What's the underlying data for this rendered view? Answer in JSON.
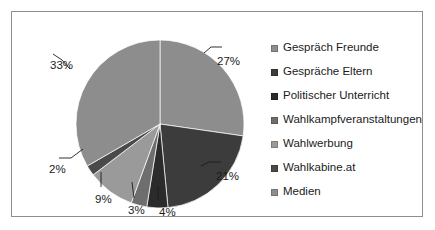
{
  "chart_data": {
    "type": "pie",
    "title": "",
    "subtitle": "",
    "xlabel": "",
    "ylabel": "",
    "legend_position": "right",
    "grid": false,
    "categories": [
      "Gespräch Freunde",
      "Gespräche Eltern",
      "Politischer Unterricht",
      "Wahlkampfveranstaltungen",
      "Wahlwerbung",
      "Wahlkabine.at",
      "Medien"
    ],
    "values": [
      27,
      21,
      4,
      3,
      9,
      2,
      33
    ],
    "data_labels": [
      "27%",
      "21%",
      "4%",
      "3%",
      "9%",
      "2%",
      "33%"
    ],
    "colors": [
      "#8d8d8d",
      "#3c3c3c",
      "#2b2b2b",
      "#6e6e6e",
      "#9a9a9a",
      "#4a4a4a",
      "#8d8d8d"
    ],
    "start_angle_deg": 0,
    "direction": "clockwise"
  },
  "legend": {
    "items": [
      {
        "label": "Gespräch Freunde",
        "color": "#8d8d8d"
      },
      {
        "label": "Gespräche Eltern",
        "color": "#3c3c3c"
      },
      {
        "label": "Politischer Unterricht",
        "color": "#2b2b2b"
      },
      {
        "label": "Wahlkampfveranstaltungen",
        "color": "#6e6e6e"
      },
      {
        "label": "Wahlwerbung",
        "color": "#9a9a9a"
      },
      {
        "label": "Wahlkabine.at",
        "color": "#4a4a4a"
      },
      {
        "label": "Medien",
        "color": "#8d8d8d"
      }
    ]
  },
  "labels": {
    "p27": "27%",
    "p33": "33%",
    "p21": "21%",
    "p2": "2%",
    "p9": "9%",
    "p3": "3%",
    "p4": "4%"
  },
  "style": {
    "frame_border": "#8e8e8e",
    "background": "#ffffff",
    "text": "#1b1b1b"
  }
}
